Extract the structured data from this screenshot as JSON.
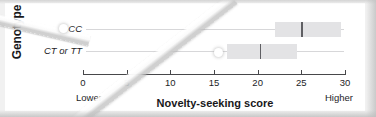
{
  "figure": {
    "y_axis_title": "Genotype",
    "x_axis_title": "Novelty-seeking score",
    "low_anchor": "Lower",
    "high_anchor": "Higher"
  },
  "chart_data": {
    "type": "bar",
    "title": "",
    "xlabel": "Novelty-seeking score",
    "ylabel": "Genotype",
    "xlim": [
      0,
      30
    ],
    "xticks": [
      0,
      5,
      10,
      15,
      20,
      25,
      30
    ],
    "xticklabels": [
      "0",
      "5",
      "10",
      "15",
      "20",
      "25",
      "30"
    ],
    "grid": true,
    "legend": null,
    "orientation": "horizontal",
    "annotations": [
      "Lower",
      "Higher"
    ],
    "categories": [
      "CC",
      "CT or TT"
    ],
    "series": [
      {
        "name": "Novelty-seeking score interval",
        "points": [
          {
            "category": "CC",
            "low": 22.0,
            "high": 29.5,
            "center": 25.0
          },
          {
            "category": "CT or TT",
            "low": 16.5,
            "high": 24.5,
            "center": 20.3
          }
        ]
      }
    ]
  },
  "colors": {
    "bar_fill": "#e3e3e5",
    "center_line": "#5f5f63",
    "axis": "#47474a",
    "gridline": "#d7d7d9",
    "text": "#1d1d1f",
    "background": "#ffffff",
    "frame": "#f1f1f1"
  },
  "ticks": [
    {
      "value": "0"
    },
    {
      "value": "5"
    },
    {
      "value": "10"
    },
    {
      "value": "15"
    },
    {
      "value": "20"
    },
    {
      "value": "25"
    },
    {
      "value": "30"
    }
  ]
}
